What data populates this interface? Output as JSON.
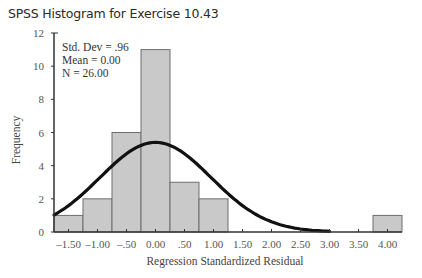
{
  "chart_data": {
    "type": "bar",
    "title": "SPSS Histogram for Exercise 10.43",
    "xlabel": "Regression Standardized Residual",
    "ylabel": "Frequency",
    "ylim": [
      0,
      12
    ],
    "y_ticks": [
      "0",
      "2",
      "4",
      "6",
      "8",
      "10",
      "12"
    ],
    "x_tick_labels": [
      "-1.50",
      "-1.00",
      "-.50",
      "0.00",
      ".50",
      "1.00",
      "1.50",
      "2.00",
      "2.50",
      "3.00",
      "3.50",
      "4.00"
    ],
    "categories": [
      "-1.50",
      "-1.00",
      "-.50",
      "0.00",
      ".50",
      "1.00",
      "1.50",
      "2.00",
      "2.50",
      "3.00",
      "3.50",
      "4.00"
    ],
    "values": [
      1,
      2,
      6,
      11,
      3,
      2,
      0,
      0,
      0,
      0,
      0,
      1
    ],
    "overlay": "normal curve",
    "stats": {
      "std_dev": "Std. Dev = .96",
      "mean": "Mean = 0.00",
      "n": "N = 26.00"
    },
    "grid": false,
    "legend": "none"
  },
  "colors": {
    "bar_fill": "#c9c9c9",
    "bar_edge": "#6e6e6e",
    "curve": "#111111",
    "axis": "#333333"
  }
}
